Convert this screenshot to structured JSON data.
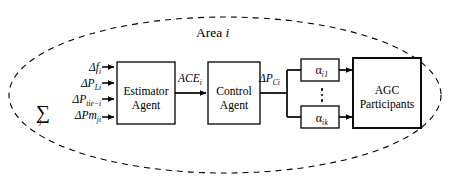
{
  "diagram": {
    "title": "Area i",
    "title_text": "Area",
    "title_index": "i",
    "boundary": {
      "shape": "dashed-ellipse",
      "style": "dashed",
      "color": "#000000"
    },
    "inputs": [
      {
        "id": "delta-f",
        "base": "Δf",
        "sub": "i",
        "symbol": "Δf₁"
      },
      {
        "id": "delta-p-l",
        "base": "ΔP",
        "sub": "Li",
        "symbol": "ΔP_Li"
      },
      {
        "id": "delta-p-tie",
        "base": "ΔP",
        "sub": "tie−i",
        "symbol": "ΔP_tie−i"
      },
      {
        "id": "sum-delta-pm",
        "base": "ΔPm",
        "sub": "ji",
        "symbol": "Σ ΔPm_ji",
        "sigma": "∑",
        "sigma_index": "j"
      }
    ],
    "blocks": [
      {
        "id": "estimator-agent",
        "label_line1": "Estimator",
        "label_line2": "Agent"
      },
      {
        "id": "control-agent",
        "label_line1": "Control",
        "label_line2": "Agent"
      },
      {
        "id": "agc-participants",
        "label_line1": "AGC",
        "label_line2": "Participants"
      }
    ],
    "signals": [
      {
        "id": "ace",
        "base": "ACE",
        "sub": "i",
        "symbol": "ACE_i"
      },
      {
        "id": "delta-pc",
        "base": "ΔP",
        "sub": "Ci",
        "symbol": "ΔP_Ci"
      }
    ],
    "gains": [
      {
        "id": "alpha-i1",
        "base": "α",
        "sub": "i1",
        "symbol": "α_i1"
      },
      {
        "id": "alpha-ik",
        "base": "α",
        "sub": "ik",
        "symbol": "α_ik"
      }
    ],
    "ellipsis": "⋮",
    "colors": {
      "stroke": "#000000",
      "background": "#ffffff"
    }
  }
}
